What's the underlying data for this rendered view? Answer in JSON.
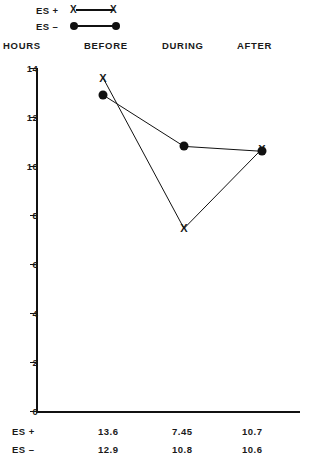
{
  "chart_data": {
    "type": "line",
    "title": "",
    "xlabel": "",
    "ylabel": "HOURS",
    "categories": [
      "BEFORE",
      "DURING",
      "AFTER"
    ],
    "ylim": [
      0,
      14
    ],
    "yticks": [
      0,
      2,
      4,
      6,
      8,
      10,
      12,
      14
    ],
    "grid": false,
    "legend_position": "top-left",
    "series": [
      {
        "name": "ES +",
        "marker": "x",
        "values": [
          13.6,
          7.45,
          10.7
        ]
      },
      {
        "name": "ES –",
        "marker": "dot",
        "values": [
          12.9,
          10.8,
          10.6
        ]
      }
    ]
  },
  "legend": {
    "rows": [
      {
        "label": "ES +",
        "marker": "x"
      },
      {
        "label": "ES –",
        "marker": "dot"
      }
    ]
  },
  "headers": {
    "hours": "HOURS",
    "before": "BEFORE",
    "during": "DURING",
    "after": "AFTER"
  },
  "axis": {
    "tick_labels": [
      "14",
      "12",
      "10",
      "8",
      "6",
      "4",
      "2",
      "0"
    ]
  },
  "table": {
    "rows": [
      {
        "label": "ES +",
        "values": [
          "13.6",
          "7.45",
          "10.7"
        ]
      },
      {
        "label": "ES –",
        "values": [
          "12.9",
          "10.8",
          "10.6"
        ]
      }
    ]
  },
  "colors": {
    "ink": "#111111",
    "background": "#ffffff"
  }
}
